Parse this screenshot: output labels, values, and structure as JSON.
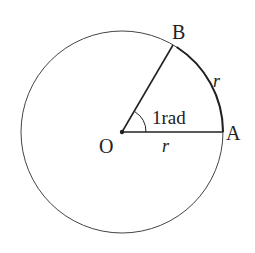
{
  "diagram": {
    "labels": {
      "center": "O",
      "point_a": "A",
      "point_b": "B",
      "radius_label": "r",
      "arc_label": "r",
      "angle_label": "1rad"
    },
    "colors": {
      "stroke": "#333333",
      "background": "#ffffff"
    }
  }
}
